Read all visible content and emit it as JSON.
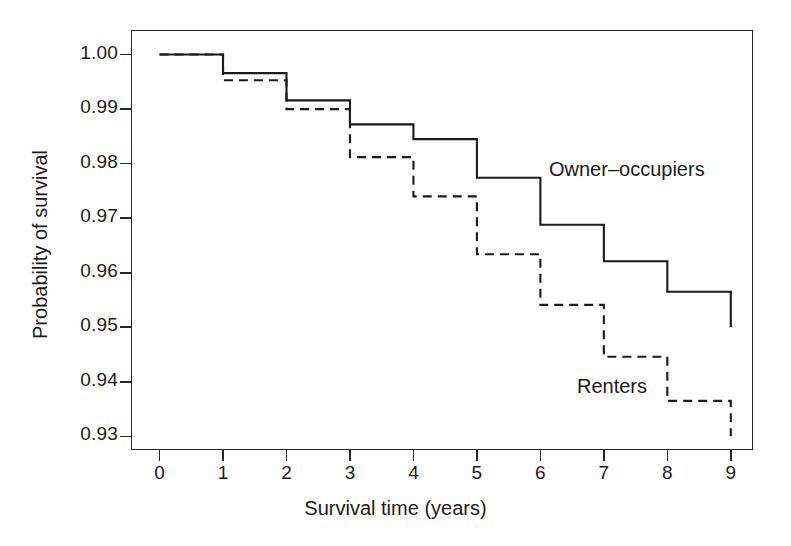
{
  "chart_data": {
    "type": "line",
    "title": "",
    "xlabel": "Survival time (years)",
    "ylabel": "Probability of survival",
    "xlim": [
      -0.45,
      9.35
    ],
    "ylim": [
      0.9275,
      1.0045
    ],
    "grid": false,
    "legend_position": "inline-annotation",
    "step_type": "post",
    "xticks": [
      0,
      1,
      2,
      3,
      4,
      5,
      6,
      7,
      8,
      9
    ],
    "xtick_labels": [
      "0",
      "1",
      "2",
      "3",
      "4",
      "5",
      "6",
      "7",
      "8",
      "9"
    ],
    "yticks": [
      0.93,
      0.94,
      0.95,
      0.96,
      0.97,
      0.98,
      0.99,
      1.0
    ],
    "ytick_labels": [
      "0.93",
      "0.94",
      "0.95",
      "0.96",
      "0.97",
      "0.98",
      "0.99",
      "1.00"
    ],
    "x": [
      0,
      1,
      2,
      3,
      4,
      5,
      6,
      7,
      8,
      9
    ],
    "series": [
      {
        "name": "Owner-occupiers",
        "label": "Owner–occupiers",
        "linestyle": "solid",
        "color": "#1a1a1a",
        "values": [
          1.0,
          0.9966,
          0.9916,
          0.9872,
          0.9845,
          0.9774,
          0.9688,
          0.9621,
          0.9565,
          0.95
        ]
      },
      {
        "name": "Renters",
        "label": "Renters",
        "linestyle": "dashed",
        "color": "#1a1a1a",
        "values": [
          1.0,
          0.9953,
          0.99,
          0.9812,
          0.974,
          0.9634,
          0.9541,
          0.9446,
          0.9365,
          0.93
        ]
      }
    ]
  },
  "annotations": {
    "owner_label": "Owner–occupiers",
    "renters_label": "Renters"
  }
}
